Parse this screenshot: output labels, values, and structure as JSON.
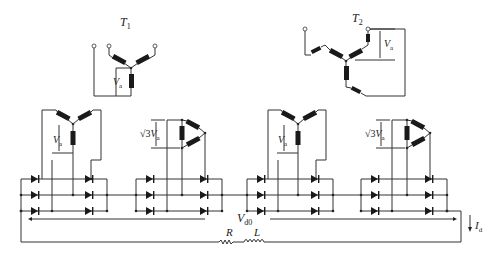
{
  "diagram": {
    "type": "circuit",
    "transformers": [
      {
        "name": "T",
        "subscript": "1",
        "label": "T1",
        "winding": "star"
      },
      {
        "name": "T",
        "subscript": "2",
        "label": "T2",
        "winding": "zigzag/star"
      }
    ],
    "labels": {
      "phase_voltage": {
        "main": "V",
        "sub": "a"
      },
      "delta_voltage": {
        "prefix": "√3",
        "main": "V",
        "sub": "a"
      },
      "output_voltage": {
        "main": "V",
        "sub": "d0"
      },
      "output_current": {
        "main": "I",
        "sub": "d"
      },
      "resistor": "R",
      "inductor": "L"
    },
    "bridges": [
      {
        "id": "bridge-1",
        "secondary": "star",
        "voltage_label": "Va"
      },
      {
        "id": "bridge-2",
        "secondary": "delta",
        "voltage_label": "√3Va"
      },
      {
        "id": "bridge-3",
        "secondary": "star",
        "voltage_label": "Va"
      },
      {
        "id": "bridge-4",
        "secondary": "delta",
        "voltage_label": "√3Va"
      }
    ],
    "colors": {
      "line": "#333333",
      "background": "#ffffff"
    }
  }
}
